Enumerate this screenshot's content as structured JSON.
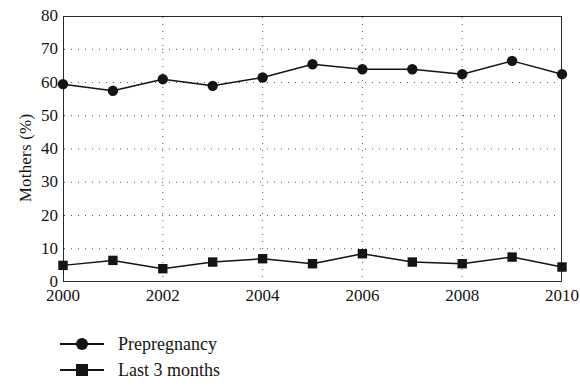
{
  "chart_data": {
    "type": "line",
    "title": "",
    "xlabel": "",
    "ylabel": "Mothers (%)",
    "xlim": [
      2000,
      2010
    ],
    "ylim": [
      0,
      80
    ],
    "ytick_values": [
      0,
      10,
      20,
      30,
      40,
      50,
      60,
      70,
      80
    ],
    "ytick_labels": [
      "0",
      "10",
      "20",
      "30",
      "40",
      "50",
      "60",
      "70",
      "80"
    ],
    "xtick_values": [
      2000,
      2002,
      2004,
      2006,
      2008,
      2010
    ],
    "xtick_labels": [
      "2000",
      "2002",
      "2004",
      "2006",
      "2008",
      "2010"
    ],
    "x": [
      2000,
      2001,
      2002,
      2003,
      2004,
      2005,
      2006,
      2007,
      2008,
      2009,
      2010
    ],
    "grid": "dotted",
    "grid_axes": "both",
    "legend_position": "below-left",
    "series": [
      {
        "name": "Prepregnancy",
        "marker": "circle",
        "color": "#141414",
        "values": [
          59.5,
          57.5,
          61,
          59,
          61.5,
          65.5,
          64,
          64,
          62.5,
          66.5,
          62.5
        ]
      },
      {
        "name": "Last 3 months",
        "marker": "square",
        "color": "#141414",
        "values": [
          5,
          6.5,
          4,
          6,
          7,
          5.5,
          8.5,
          6,
          5.5,
          7.5,
          4.5
        ]
      }
    ]
  },
  "legend": {
    "items": [
      {
        "label": "Prepregnancy",
        "marker": "circle-marker-icon"
      },
      {
        "label": "Last 3 months",
        "marker": "square-marker-icon"
      }
    ]
  }
}
